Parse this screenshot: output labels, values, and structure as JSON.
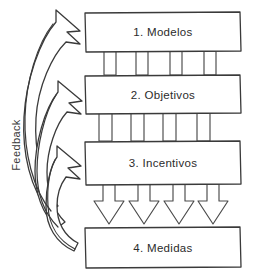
{
  "diagram": {
    "type": "flow-diagram",
    "orientation": "vertical-top-down",
    "background_color": "#ffffff",
    "stroke_color": "#3a3a3a",
    "text_color": "#2b2b2b",
    "style": "hand-drawn sketch outline",
    "boxes": [
      {
        "id": "box-1",
        "label": "1. Modelos",
        "order": 1
      },
      {
        "id": "box-2",
        "label": "2. Objetivos",
        "order": 2
      },
      {
        "id": "box-3",
        "label": "3. Incentivos",
        "order": 3
      },
      {
        "id": "box-4",
        "label": "4. Medidas",
        "order": 4
      }
    ],
    "connectors": [
      {
        "id": "connector-1-2",
        "from": "box-1",
        "to": "box-2",
        "kind": "bars",
        "count": 4
      },
      {
        "id": "connector-2-3",
        "from": "box-2",
        "to": "box-3",
        "kind": "bars",
        "count": 4
      },
      {
        "id": "connector-3-4",
        "from": "box-3",
        "to": "box-4",
        "kind": "down-arrows",
        "count": 4
      }
    ],
    "feedback": {
      "label": "Feedback",
      "rotation_degrees": -90,
      "arrow_count": 3,
      "from": "box-4",
      "to": [
        "box-1",
        "box-2",
        "box-3"
      ],
      "direction": "upward-left-curving-right"
    }
  }
}
